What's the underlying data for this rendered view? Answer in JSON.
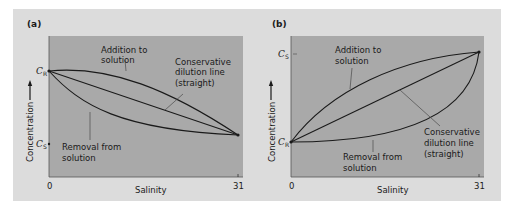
{
  "figure": {
    "panels": [
      {
        "id": "a",
        "letter": "(a)",
        "y_axis_label": "Concentration",
        "x_axis_label": "Salinity",
        "x_ticks": [
          "0",
          "31"
        ],
        "y_markers": [
          {
            "symbol": "C",
            "subscript": "R",
            "position": "upper"
          },
          {
            "symbol": "C",
            "subscript": "S",
            "position": "lower"
          }
        ],
        "annotations": {
          "addition": [
            "Addition to",
            "solution"
          ],
          "conservative": [
            "Conservative",
            "dilution line",
            "(straight)"
          ],
          "removal": [
            "Removal from",
            "solution"
          ]
        }
      },
      {
        "id": "b",
        "letter": "(b)",
        "y_axis_label": "Concentration",
        "x_axis_label": "Salinity",
        "x_ticks": [
          "0",
          "31"
        ],
        "y_markers": [
          {
            "symbol": "C",
            "subscript": "S",
            "position": "upper"
          },
          {
            "symbol": "C",
            "subscript": "R",
            "position": "lower"
          }
        ],
        "annotations": {
          "addition": [
            "Addition to",
            "solution"
          ],
          "conservative": [
            "Conservative",
            "dilution line",
            "(straight)"
          ],
          "removal": [
            "Removal from",
            "solution"
          ]
        }
      }
    ],
    "colors": {
      "frame": "#dcdcdc",
      "plot_area": "#a9a9a9",
      "line": "#1a1a1a",
      "leader": "#4a4a4a"
    }
  }
}
